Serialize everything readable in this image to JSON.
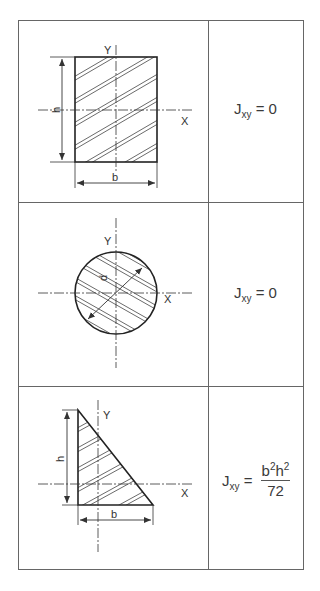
{
  "table": {
    "rows": [
      {
        "shape": "rectangle",
        "labels": {
          "y_axis": "Y",
          "x_axis": "X",
          "height": "h",
          "width": "b"
        },
        "formula": {
          "symbol": "J",
          "subscript": "xy",
          "equals": "=",
          "value": "0"
        }
      },
      {
        "shape": "circle",
        "labels": {
          "y_axis": "Y",
          "x_axis": "X",
          "diameter": "d"
        },
        "formula": {
          "symbol": "J",
          "subscript": "xy",
          "equals": "=",
          "value": "0"
        }
      },
      {
        "shape": "right-triangle",
        "labels": {
          "y_axis": "Y",
          "x_axis": "X",
          "height": "h",
          "width": "b"
        },
        "formula": {
          "symbol": "J",
          "subscript": "xy",
          "equals": "=",
          "numerator_b": "b",
          "numerator_b_exp": "2",
          "numerator_h": "h",
          "numerator_h_exp": "2",
          "denominator": "72"
        }
      }
    ]
  },
  "colors": {
    "line": "#333333",
    "border": "#555555",
    "background": "#ffffff"
  }
}
